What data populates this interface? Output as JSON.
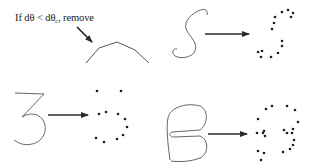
{
  "annotation": {
    "prefix": "If dθ < dθ",
    "subscript": "c",
    "suffix": ", remove"
  },
  "colors": {
    "ink": "#2a2a2a",
    "stroke": "#555555",
    "dot": "#1e1e1e",
    "background": "#ffffff"
  },
  "panels": [
    {
      "id": "angle-removal",
      "pointer_arrow": {
        "from": [
          77,
          27
        ],
        "to": [
          92,
          42
        ]
      },
      "polyline": [
        [
          86,
          63
        ],
        [
          99,
          48
        ],
        [
          117,
          42
        ],
        [
          135,
          50
        ],
        [
          149,
          63
        ]
      ]
    },
    {
      "id": "S",
      "glyph": "S",
      "arrow": {
        "from": [
          205,
          34
        ],
        "to": [
          249,
          34
        ]
      },
      "dots": [
        [
          282,
          12
        ],
        [
          288,
          10
        ],
        [
          293,
          13
        ],
        [
          291,
          17
        ],
        [
          275,
          17
        ],
        [
          274,
          23
        ],
        [
          272,
          29
        ],
        [
          282,
          41
        ],
        [
          282,
          46
        ],
        [
          278,
          53
        ],
        [
          258,
          52
        ],
        [
          262,
          51
        ],
        [
          261,
          57
        ],
        [
          271,
          57
        ]
      ]
    },
    {
      "id": "3",
      "glyph": "3",
      "arrow": {
        "from": [
          48,
          115
        ],
        "to": [
          88,
          115
        ]
      },
      "dots": [
        [
          97,
          91
        ],
        [
          121,
          91
        ],
        [
          99,
          114
        ],
        [
          106,
          112
        ],
        [
          118,
          114
        ],
        [
          125,
          119
        ],
        [
          127,
          127
        ],
        [
          123,
          135
        ],
        [
          96,
          138
        ],
        [
          104,
          142
        ],
        [
          117,
          139
        ]
      ]
    },
    {
      "id": "B",
      "glyph": "B",
      "arrow": {
        "from": [
          208,
          134
        ],
        "to": [
          247,
          134
        ]
      },
      "dots": [
        [
          266,
          109
        ],
        [
          272,
          106
        ],
        [
          287,
          106
        ],
        [
          295,
          110
        ],
        [
          258,
          119
        ],
        [
          298,
          122
        ],
        [
          257,
          133
        ],
        [
          263,
          133
        ],
        [
          264,
          131
        ],
        [
          265,
          136
        ],
        [
          284,
          130
        ],
        [
          287,
          133
        ],
        [
          292,
          133
        ],
        [
          293,
          129
        ],
        [
          294,
          140
        ],
        [
          293,
          145
        ],
        [
          290,
          149
        ],
        [
          283,
          152
        ],
        [
          258,
          151
        ],
        [
          264,
          153
        ],
        [
          261,
          160
        ]
      ]
    }
  ]
}
